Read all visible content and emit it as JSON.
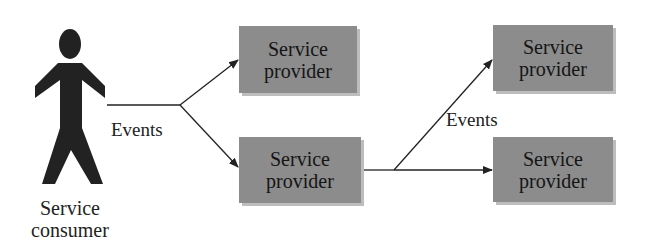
{
  "diagram": {
    "consumer": {
      "line1": "Service",
      "line2": "consumer",
      "icon": "person-icon"
    },
    "providers": [
      {
        "line1": "Service",
        "line2": "provider"
      },
      {
        "line1": "Service",
        "line2": "provider"
      },
      {
        "line1": "Service",
        "line2": "provider"
      },
      {
        "line1": "Service",
        "line2": "provider"
      }
    ],
    "edge_labels": [
      "Events",
      "Events"
    ],
    "colors": {
      "box_fill": "#8c8c8c",
      "box_shadow": "#bdbdbd",
      "figure": "#222222",
      "line": "#222222"
    }
  }
}
